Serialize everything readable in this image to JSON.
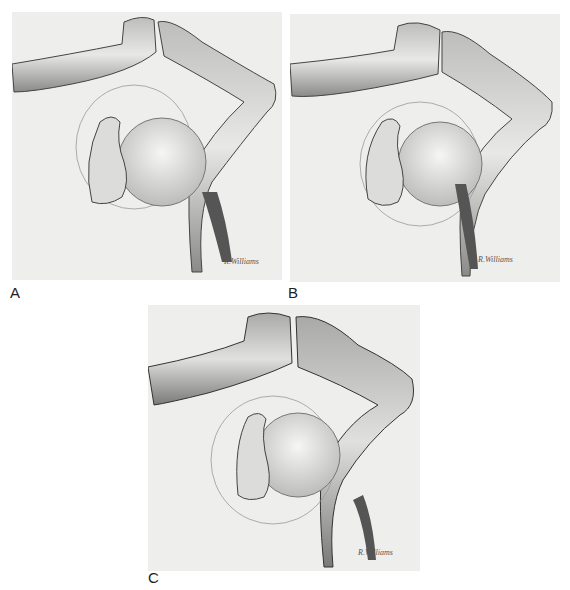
{
  "figure": {
    "panels": [
      {
        "label": "A",
        "description": "Shoulder illustration: clavicle and acromion ends meeting at top, coracoid process, humeral head within glenoid outline, scapular spine"
      },
      {
        "label": "B",
        "description": "Shoulder illustration variant with fibrous strands below acromion"
      },
      {
        "label": "C",
        "description": "Shoulder illustration variant with enlarged acromion end"
      }
    ],
    "signature": "R. Williams",
    "colors": {
      "background": "#ffffff",
      "panel_bg": "#eeeeec",
      "ink": "#2a2a2a"
    }
  }
}
